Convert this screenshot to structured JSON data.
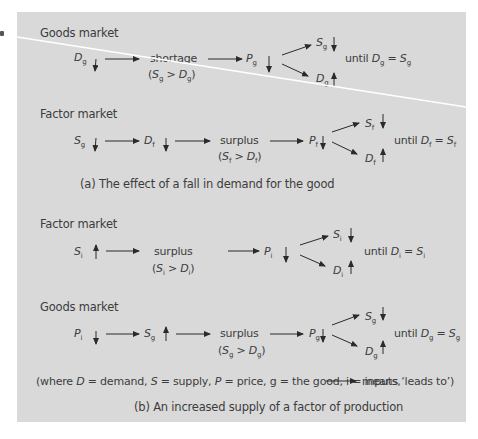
{
  "figure": {
    "panel_color": "#d9d9d9",
    "arrow_color": "#2a2a2a",
    "divider_color": "#ffffff",
    "partA": {
      "caption": "(a) The effect of a fall in demand for the good",
      "goods_market": {
        "label": "Goods market",
        "start": {
          "var": "D",
          "sub": "g",
          "dir": "down"
        },
        "state": {
          "word": "shortage",
          "cond_left_var": "S",
          "cond_left_sub": "g",
          "cond_op": ">",
          "cond_right_var": "D",
          "cond_right_sub": "g"
        },
        "price": {
          "var": "P",
          "sub": "g",
          "dir": "down"
        },
        "supply_out": {
          "var": "S",
          "sub": "g",
          "dir": "down"
        },
        "demand_out": {
          "var": "D",
          "sub": "g",
          "dir": "up"
        },
        "until": {
          "word": "until",
          "left_var": "D",
          "left_sub": "g",
          "eq": "=",
          "right_var": "S",
          "right_sub": "g"
        }
      },
      "factor_market": {
        "label": "Factor market",
        "start": {
          "var": "S",
          "sub": "g",
          "dir": "down"
        },
        "second": {
          "var": "D",
          "sub": "f",
          "dir": "down"
        },
        "state": {
          "word": "surplus",
          "cond_left_var": "S",
          "cond_left_sub": "f",
          "cond_op": ">",
          "cond_right_var": "D",
          "cond_right_sub": "f"
        },
        "price": {
          "var": "P",
          "sub": "f",
          "dir": "down"
        },
        "supply_out": {
          "var": "S",
          "sub": "f",
          "dir": "down"
        },
        "demand_out": {
          "var": "D",
          "sub": "f",
          "dir": "up"
        },
        "until": {
          "word": "until",
          "left_var": "D",
          "left_sub": "f",
          "eq": "=",
          "right_var": "S",
          "right_sub": "f"
        }
      }
    },
    "partB": {
      "caption": "(b) An increased supply of a factor of production",
      "legend": {
        "text_before": "(where ",
        "D": "D",
        "d_def": " = demand, ",
        "S": "S",
        "s_def": " = supply, ",
        "P": "P",
        "p_def": " = price, g = the good, i = inputs,",
        "text_after": "means ‘leads to’)"
      },
      "factor_market": {
        "label": "Factor market",
        "start": {
          "var": "S",
          "sub": "i",
          "dir": "up"
        },
        "state": {
          "word": "surplus",
          "cond_left_var": "S",
          "cond_left_sub": "i",
          "cond_op": ">",
          "cond_right_var": "D",
          "cond_right_sub": "i"
        },
        "price": {
          "var": "P",
          "sub": "i",
          "dir": "down"
        },
        "supply_out": {
          "var": "S",
          "sub": "i",
          "dir": "down"
        },
        "demand_out": {
          "var": "D",
          "sub": "i",
          "dir": "up"
        },
        "until": {
          "word": "until",
          "left_var": "D",
          "left_sub": "i",
          "eq": "=",
          "right_var": "S",
          "right_sub": "i"
        }
      },
      "goods_market": {
        "label": "Goods market",
        "start": {
          "var": "P",
          "sub": "i",
          "dir": "down"
        },
        "second": {
          "var": "S",
          "sub": "g",
          "dir": "up"
        },
        "state": {
          "word": "surplus",
          "cond_left_var": "S",
          "cond_left_sub": "g",
          "cond_op": ">",
          "cond_right_var": "D",
          "cond_right_sub": "g"
        },
        "price": {
          "var": "P",
          "sub": "g",
          "dir": "down"
        },
        "supply_out": {
          "var": "S",
          "sub": "g",
          "dir": "down"
        },
        "demand_out": {
          "var": "D",
          "sub": "g",
          "dir": "up"
        },
        "until": {
          "word": "until",
          "left_var": "D",
          "left_sub": "g",
          "eq": "=",
          "right_var": "S",
          "right_sub": "g"
        }
      }
    }
  }
}
